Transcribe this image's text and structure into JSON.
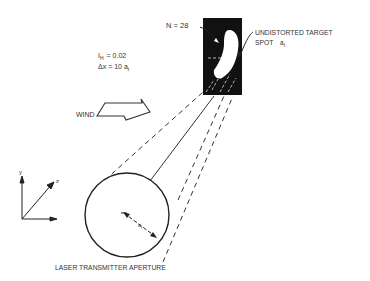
{
  "figure": {
    "labels": {
      "n_label": "N = 28",
      "target_label_line1": "UNDISTORTED TARGET",
      "target_label_line2": "SPOT",
      "target_symbol": "a",
      "target_symbol_sub": "t",
      "ih_symbol": "I",
      "ih_sub": "H",
      "ih_value": "= 0.02",
      "dx_symbol": "Δx",
      "dx_value": "= 10 a",
      "dx_sub": "t",
      "wind_label": "WIND",
      "aperture_label": "LASER TRANSMITTER APERTURE",
      "radius_label": "a",
      "radius_sub": "t",
      "axis_y": "y",
      "axis_z": "z"
    },
    "colors": {
      "ink": "#222222",
      "target_bg": "#111111",
      "spot": "#ffffff"
    }
  }
}
